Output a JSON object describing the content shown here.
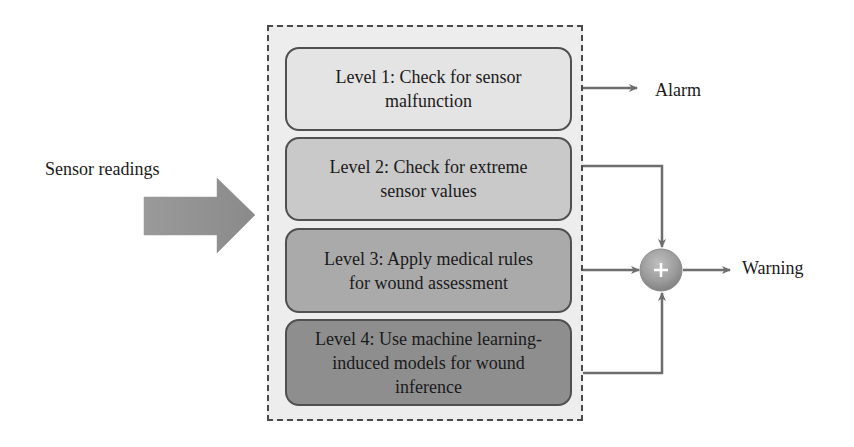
{
  "diagram": {
    "input": {
      "label": "Sensor readings"
    },
    "levels": [
      {
        "id": 1,
        "text": "Level 1: Check for sensor malfunction",
        "lines": [
          "Level 1: Check for sensor",
          "malfunction"
        ],
        "fill": "#e4e4e4",
        "output": "Alarm"
      },
      {
        "id": 2,
        "text": "Level 2: Check for extreme sensor values",
        "lines": [
          "Level 2: Check for extreme",
          "sensor values"
        ],
        "fill": "#c9c9c9",
        "output": "Warning"
      },
      {
        "id": 3,
        "text": "Level 3: Apply medical rules for wound assessment",
        "lines": [
          "Level 3: Apply medical rules",
          "for wound assessment"
        ],
        "fill": "#aaaaaa",
        "output": "Warning"
      },
      {
        "id": 4,
        "text": "Level 4: Use machine learning-induced models for wound inference",
        "lines": [
          "Level 4: Use machine learning-",
          "induced models for wound",
          "inference"
        ],
        "fill": "#8e8e8e",
        "output": "Warning"
      }
    ],
    "combiner": {
      "symbol": "+",
      "icon": "plus-circle-icon"
    },
    "outputs": {
      "alarm": "Alarm",
      "warning": "Warning"
    },
    "colors": {
      "connector": "#6e6e6e",
      "container_bg": "#ededed",
      "container_border": "#4a4a4a",
      "box_border": "#505050"
    }
  }
}
